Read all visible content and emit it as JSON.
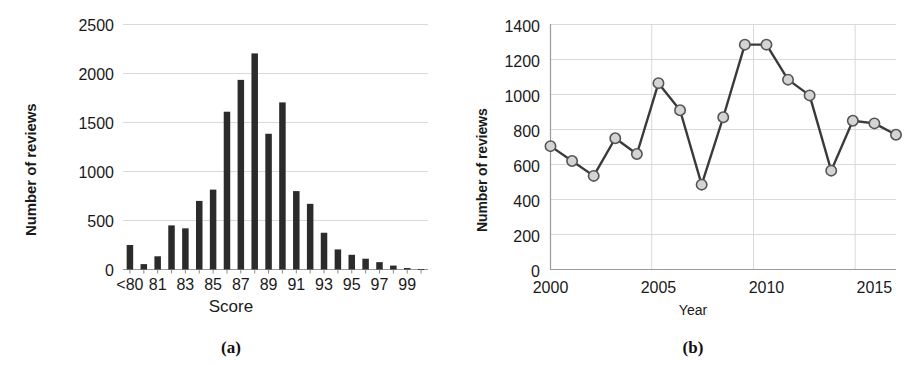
{
  "figure": {
    "panels": [
      {
        "caption": "(a)",
        "chart_data": {
          "type": "bar",
          "title": "",
          "xlabel": "Score",
          "ylabel": "Number of reviews",
          "categories": [
            "<80",
            "80",
            "81",
            "82",
            "83",
            "84",
            "85",
            "86",
            "87",
            "88",
            "89",
            "90",
            "91",
            "92",
            "93",
            "94",
            "95",
            "96",
            "97",
            "98",
            "99",
            "100"
          ],
          "tick_labels": [
            "<80",
            "",
            "81",
            "",
            "83",
            "",
            "85",
            "",
            "87",
            "",
            "89",
            "",
            "91",
            "",
            "93",
            "",
            "95",
            "",
            "97",
            "",
            "99",
            ""
          ],
          "values": [
            250,
            55,
            135,
            450,
            420,
            700,
            815,
            1610,
            1935,
            2205,
            1385,
            1705,
            800,
            670,
            375,
            205,
            150,
            110,
            75,
            40,
            15,
            5
          ],
          "ylim": [
            0,
            2500
          ],
          "yticks": [
            0,
            500,
            1000,
            1500,
            2000,
            2500
          ],
          "ytick_labels": [
            "0",
            "500",
            "1000",
            "1500",
            "2000",
            "2500"
          ],
          "grid": true,
          "legend": "none",
          "bar_color": "#2b2b2b"
        }
      },
      {
        "caption": "(b)",
        "chart_data": {
          "type": "line",
          "title": "",
          "xlabel": "Year",
          "ylabel": "Number of reviews",
          "x": [
            2000,
            2001,
            2002,
            2003,
            2004,
            2005,
            2006,
            2007,
            2008,
            2009,
            2010,
            2011,
            2012,
            2013,
            2014,
            2015,
            2016
          ],
          "values": [
            705,
            620,
            535,
            750,
            660,
            1065,
            910,
            485,
            870,
            1285,
            1285,
            1085,
            995,
            565,
            850,
            835,
            770
          ],
          "xlim": [
            2000,
            2016
          ],
          "xticks": [
            2000,
            2005,
            2010,
            2015
          ],
          "xtick_labels": [
            "2000",
            "2005",
            "2010",
            "2015"
          ],
          "ylim": [
            0,
            1400
          ],
          "yticks": [
            0,
            200,
            400,
            600,
            800,
            1000,
            1200,
            1400
          ],
          "ytick_labels": [
            "0",
            "200",
            "400",
            "600",
            "800",
            "1000",
            "1200",
            "1400"
          ],
          "grid": true,
          "legend": "none",
          "line_color": "#3a3a3a",
          "marker_fill": "#d4d4d4",
          "marker_stroke": "#555555"
        }
      }
    ]
  }
}
